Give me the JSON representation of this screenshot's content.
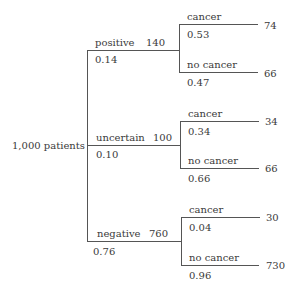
{
  "root": {
    "label": "1,000 patients",
    "count": 1000
  },
  "branches": [
    {
      "label": "positive",
      "count": "140",
      "prob": "0.14",
      "children": [
        {
          "label": "cancer",
          "prob": "0.53",
          "count": "74"
        },
        {
          "label": "no cancer",
          "prob": "0.47",
          "count": "66"
        }
      ]
    },
    {
      "label": "uncertain",
      "count": "100",
      "prob": "0.10",
      "children": [
        {
          "label": "cancer",
          "prob": "0.34",
          "count": "34"
        },
        {
          "label": "no cancer",
          "prob": "0.66",
          "count": "66"
        }
      ]
    },
    {
      "label": "negative",
      "count": "760",
      "prob": "0.76",
      "children": [
        {
          "label": "cancer",
          "prob": "0.04",
          "count": "30"
        },
        {
          "label": "no cancer",
          "prob": "0.96",
          "count": "730"
        }
      ]
    }
  ],
  "colors": {
    "line": "#555555",
    "text": "#3a3a3a",
    "background": "#ffffff"
  }
}
